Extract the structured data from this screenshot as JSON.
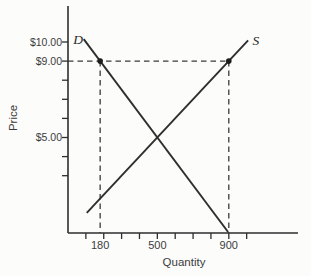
{
  "figure": {
    "background": "#fcfcfb",
    "ink": "#2e2e2e",
    "text_color": "#3b3b3b",
    "dash_color": "#3a3a3a"
  },
  "chart_data": {
    "type": "line",
    "title": "",
    "xlabel": "Quantity",
    "ylabel": "Price",
    "x_axis": {
      "tick_min": 100,
      "tick_max": 1000,
      "tick_step": 100,
      "labeled_ticks": [
        {
          "quantity": 180,
          "label": "180"
        },
        {
          "quantity": 500,
          "label": "500"
        },
        {
          "quantity": 900,
          "label": "900"
        }
      ]
    },
    "y_axis": {
      "ticks": [
        3,
        4,
        5,
        6,
        7,
        8,
        9,
        10
      ],
      "labeled_ticks": [
        {
          "price": 10,
          "label": "$10.00"
        },
        {
          "price": 9,
          "label": "$9.00"
        },
        {
          "price": 5,
          "label": "$5.00"
        }
      ]
    },
    "series": [
      {
        "name": "demand",
        "label": "D",
        "points": [
          [
            180,
            9
          ],
          [
            500,
            5
          ],
          [
            900,
            0
          ]
        ]
      },
      {
        "name": "supply",
        "label": "S",
        "points": [
          [
            0,
            0
          ],
          [
            500,
            5
          ],
          [
            900,
            9
          ]
        ]
      }
    ],
    "annotations": {
      "dashed_price_line": 9,
      "quantity_demanded_at_price_line": 180,
      "quantity_supplied_at_price_line": 900,
      "equilibrium": {
        "price": 5,
        "quantity": 500
      },
      "markers": [
        [
          180,
          9
        ],
        [
          900,
          9
        ]
      ]
    }
  }
}
